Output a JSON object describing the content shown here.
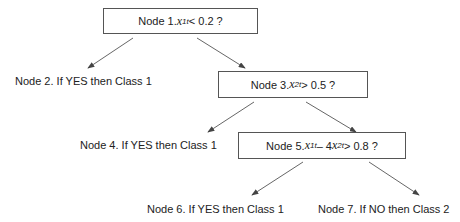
{
  "diagram": {
    "type": "decision-tree",
    "nodes": [
      {
        "id": 1,
        "kind": "decision",
        "prefix": "Node 1. ",
        "var": "x",
        "sub": "1t",
        "rest": " < 0.2 ?"
      },
      {
        "id": 2,
        "kind": "leaf",
        "label": "Node 2. If YES then Class 1"
      },
      {
        "id": 3,
        "kind": "decision",
        "prefix": "Node 3. ",
        "var": "x",
        "sub": "2t",
        "rest": " > 0.5 ?"
      },
      {
        "id": 4,
        "kind": "leaf",
        "label": "Node 4. If YES then Class 1"
      },
      {
        "id": 5,
        "kind": "decision",
        "prefix": "Node 5. ",
        "var": "x",
        "sub": "1t",
        "mid": " – 4",
        "var2": "x",
        "sub2": "2t",
        "rest": " > 0.8 ?"
      },
      {
        "id": 6,
        "kind": "leaf",
        "label": "Node 6. If YES then Class 1"
      },
      {
        "id": 7,
        "kind": "leaf",
        "label": "Node 7. If NO then Class 2"
      }
    ],
    "edges": [
      [
        1,
        2
      ],
      [
        1,
        3
      ],
      [
        3,
        4
      ],
      [
        3,
        5
      ],
      [
        5,
        6
      ],
      [
        5,
        7
      ]
    ]
  }
}
